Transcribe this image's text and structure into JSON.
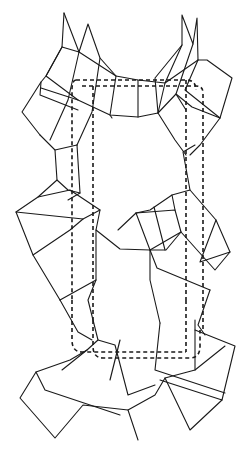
{
  "diagram": {
    "title": "",
    "colors": {
      "line": "#1a1a1a",
      "background": "#ffffff"
    },
    "unit_cell": [
      "M76,80 L186,80 Q196,80 196,90",
      "M76,80 Q72,80 72,90 L72,300",
      "M82,86 L196,86 Q203,86 203,93 L203,330",
      "M93,86 L93,320",
      "M186,80 L186,300",
      "M72,300 L72,340 Q72,352 82,352 L186,352",
      "M93,320 L93,346 Q93,358 103,358 L190,358 Q200,358 200,346 L200,330",
      "M186,300 L186,352"
    ],
    "edges": [
      "M64,13 L62,47 L79,52 L88,24 L100,58 L116,76",
      "M64,13 L79,52",
      "M62,47 L46,76 L41,82 L22,112 L40,135",
      "M79,52 L116,76 L138,80 L165,83 L198,60 L197,18 L193,44 L182,15 L182,45 L165,83",
      "M198,60 L207,60 L232,78 L220,118 L192,107 L176,94 L158,113 L138,117 L110,115 L78,100 L41,88",
      "M41,82 L40,95 L78,110",
      "M62,47 L46,76 L78,100",
      "M79,52 L68,100 L50,140",
      "M100,58 L92,112 L77,145",
      "M116,76 L110,115 L112,118",
      "M138,80 L138,117",
      "M165,83 L158,113",
      "M193,44 L176,94 L186,110",
      "M182,45 L155,78 L158,113",
      "M198,60 L185,90 L220,118",
      "M158,113 L175,140 L186,155",
      "M220,118 L200,145 L190,155",
      "M40,135 L55,150 L57,180 L38,197 L16,212 L33,255 L60,300",
      "M77,145 L55,150",
      "M77,145 L80,193 L68,200",
      "M57,180 L68,190 L80,193",
      "M38,197 L70,190 L100,210 L96,230 L120,249 L150,250 L166,250 L181,232 L175,210 L136,213 L118,230",
      "M16,212 L83,219 L100,210",
      "M33,255 L70,230 L83,219",
      "M60,300 L96,280 L96,230",
      "M136,213 L150,250",
      "M154,207 L165,250",
      "M175,210 L172,195 L150,210 L136,213",
      "M172,195 L190,190 L216,220 L230,252 L215,270 L181,232",
      "M190,190 L183,152 L195,145",
      "M181,232 L150,250 L157,268 L210,290",
      "M216,220 L200,262 L230,252",
      "M96,280 L88,300 L98,340 L87,350 L70,360 L36,372 L20,398 L55,438 L83,405 L128,410 L155,395 L165,378 L195,370 L225,346",
      "M36,372 L45,390 L120,415",
      "M98,340 L115,345 L128,395 L155,385",
      "M120,340 L110,380",
      "M160,323 L155,370 L225,393",
      "M195,320 L195,370",
      "M195,330 L235,346 L222,400 L160,380",
      "M60,300 L78,332 L92,340",
      "M210,290 L198,325 L205,335",
      "M150,250 L150,280 L160,323",
      "M87,350 L62,370",
      "M165,378 L190,430 L222,400",
      "M128,410 L138,440"
    ]
  }
}
